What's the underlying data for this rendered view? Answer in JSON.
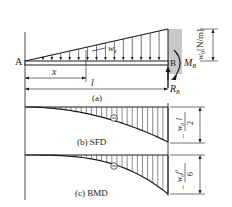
{
  "figure": {
    "beam": {
      "left_support_label": "A",
      "right_support_label": "B",
      "distributed_load_label": "w",
      "distributed_load_subscript": "x",
      "max_load_label": "w",
      "max_load_subscript": "0",
      "max_load_units": "[N/m]",
      "moment_label": "M",
      "moment_subscript": "B",
      "reaction_label": "R",
      "reaction_subscript": "B",
      "position_dim_label": "x",
      "length_dim_label": "l",
      "caption": "(a)"
    },
    "sfd": {
      "caption": "(b) SFD",
      "sign": "⊖",
      "max_value_numerator": "w",
      "max_value_numerator_sub": "0",
      "max_value_numerator_tail": "l",
      "max_value_denominator": "2",
      "max_value_sign": "−"
    },
    "bmd": {
      "caption": "(c) BMD",
      "sign": "⊖",
      "max_value_numerator": "w",
      "max_value_numerator_sub": "0",
      "max_value_numerator_tail": "l",
      "max_value_numerator_sup": "2",
      "max_value_denominator": "6",
      "max_value_sign": "−"
    },
    "colors": {
      "ink": "#1a1a1a",
      "wall": "#c8c8c8"
    }
  }
}
